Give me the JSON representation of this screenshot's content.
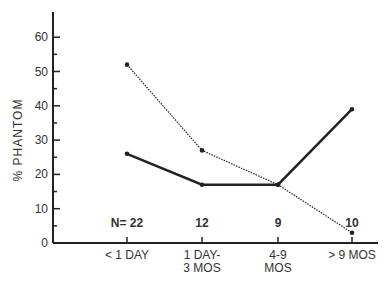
{
  "chart_data": {
    "type": "line",
    "title": "",
    "xlabel": "",
    "ylabel": "% PHANTOM",
    "categories": [
      "< 1 DAY",
      "1 DAY- 3 MOS",
      "4-9 MOS",
      "> 9 MOS"
    ],
    "category_lines": [
      [
        "< 1 DAY"
      ],
      [
        "1 DAY-",
        "3 MOS"
      ],
      [
        "4-9",
        "MOS"
      ],
      [
        "> 9 MOS"
      ]
    ],
    "n_labels": [
      "N= 22",
      "12",
      "9",
      "10"
    ],
    "series": [
      {
        "name": "solid",
        "style": "solid",
        "values": [
          26,
          17,
          17,
          39
        ]
      },
      {
        "name": "dotted",
        "style": "dotted",
        "values": [
          52,
          27,
          17,
          3
        ]
      }
    ],
    "yticks": [
      0,
      10,
      20,
      30,
      40,
      50,
      60
    ],
    "ylim": [
      0,
      65
    ],
    "grid": false,
    "legend": "none"
  }
}
